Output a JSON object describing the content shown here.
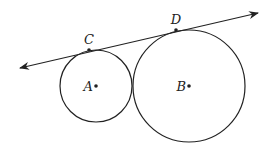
{
  "diagram": {
    "line": {
      "x1": 20,
      "y1": 68,
      "x2": 258,
      "y2": 13,
      "arrows": "both",
      "color": "#222222"
    },
    "circles": [
      {
        "id": "A",
        "cx": 96,
        "cy": 86,
        "r": 36,
        "center_label": "A"
      },
      {
        "id": "B",
        "cx": 189,
        "cy": 86,
        "r": 56,
        "center_label": "B"
      }
    ],
    "tangent_points": [
      {
        "label": "C",
        "x": 89,
        "y": 50
      },
      {
        "label": "D",
        "x": 176,
        "y": 30
      }
    ]
  }
}
